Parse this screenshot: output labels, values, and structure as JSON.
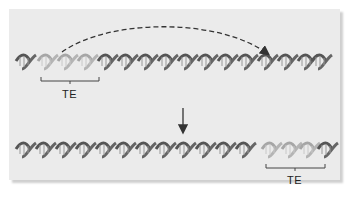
{
  "diagram": {
    "colors": {
      "panel_bg": "#ebebeb",
      "dna_dark": "#5a5a5a",
      "dna_rung": "#8c8c8c",
      "te_light": "#a9a9a9",
      "arrow": "#333333"
    },
    "top_strand": {
      "label": "TE",
      "te_position": "left"
    },
    "bottom_strand": {
      "label": "TE",
      "te_position": "right"
    },
    "arrows": [
      {
        "type": "dashed-curved",
        "from": "top-left TE",
        "to": "top-right insertion site"
      },
      {
        "type": "solid-vertical",
        "from": "top strand",
        "to": "bottom strand"
      }
    ]
  }
}
